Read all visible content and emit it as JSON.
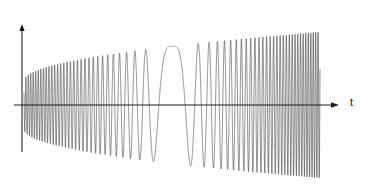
{
  "figure": {
    "background_color": "#ffffff",
    "ink_color": "#1a1a1a",
    "width": 369,
    "height": 193
  },
  "formula": {
    "full_text": "(1+√t )cos 50(2 − t)²",
    "open_paren": "(1+",
    "sqrt_sign": "√",
    "radicand": "t",
    "close_paren": " )cos",
    "amplitude_factor": "50(2 − t)",
    "exponent": "2",
    "cos_prefix": "cos",
    "coefficient": "50",
    "inner": "(2 − t)"
  },
  "axes": {
    "horizontal_label": "t",
    "vertical_label": "",
    "origin_x": 22,
    "origin_y": 105,
    "x_axis_end": 338,
    "y_axis_top": 25,
    "y_axis_bottom": 152,
    "has_arrow_x": true,
    "has_arrow_y": true,
    "grid": false,
    "ticks": []
  },
  "chart_data": {
    "type": "line",
    "xlabel": "t",
    "ylabel": "",
    "function": "(1 + sqrt(t)) * cos(50 * (2 - t)^2)",
    "envelope_function": "1 + sqrt(t)",
    "phase_function": "50 * (2 - t)^2",
    "xlim": [
      0.0,
      4.0
    ],
    "ylim": [
      -3.0,
      3.0
    ],
    "samples": 4000,
    "turning_point_t": 2.0,
    "legend": [],
    "annotations": [],
    "series": [
      {
        "name": "(1+√t )cos 50(2 − t)²",
        "color": "#1a1a1a",
        "linewidth": 0.55
      }
    ],
    "x": [
      0.0,
      0.2,
      0.4,
      0.6,
      0.8,
      1.0,
      1.2,
      1.4,
      1.6,
      1.8,
      2.0,
      2.2,
      2.4,
      2.6,
      2.8,
      3.0,
      3.2,
      3.4,
      3.6,
      3.8,
      4.0
    ],
    "envelope_values": [
      1.0,
      1.447,
      1.632,
      1.775,
      1.894,
      2.0,
      2.095,
      2.183,
      2.265,
      2.342,
      2.414,
      2.483,
      2.549,
      2.612,
      2.673,
      2.732,
      2.789,
      2.844,
      2.897,
      2.949,
      3.0
    ],
    "instantaneous_frequency_values": [
      200,
      180,
      160,
      140,
      120,
      100,
      80,
      60,
      40,
      20,
      0,
      20,
      40,
      60,
      80,
      100,
      120,
      140,
      160,
      180,
      200
    ]
  }
}
